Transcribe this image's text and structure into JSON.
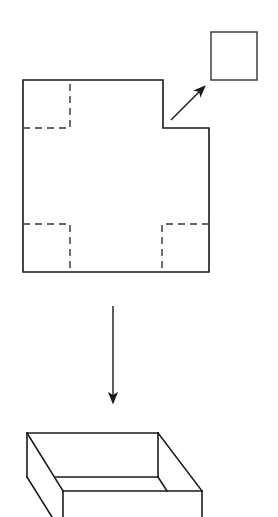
{
  "diagram": {
    "title": "",
    "canvas": {
      "width": 278,
      "height": 517,
      "background": "#ffffff"
    },
    "colors": {
      "stroke": "#1a1a1a",
      "dash_stroke": "#333333"
    },
    "net": {
      "description": "Square sheet with corner squares marked by dashed lines; one corner square cut out",
      "outline_points": "23,80 163,80 163,128 209,128 209,272 23,272 23,80",
      "dashed_corners": [
        {
          "name": "top-left",
          "path": "M23,128 L70,128 L70,80"
        },
        {
          "name": "bottom-left",
          "path": "M23,224 L70,224 L70,272"
        },
        {
          "name": "bottom-right",
          "path": "M209,224 L162,224 L162,272"
        }
      ]
    },
    "cut_square": {
      "x": 211,
      "y": 32,
      "width": 46,
      "height": 48
    },
    "cut_arrow": {
      "x1": 171,
      "y1": 120,
      "x2": 204,
      "y2": 87
    },
    "fold_arrow": {
      "x1": 113,
      "y1": 306,
      "x2": 113,
      "y2": 402
    },
    "box": {
      "description": "Open-top box formed by folding up the sides",
      "edges": [
        "M27,433 L158,433",
        "M27,433 L63,491",
        "M158,433 L202,491",
        "M63,491 L202,491",
        "M27,433 L27,477",
        "M27,477 L52,517",
        "M158,433 L158,477",
        "M55,477 L158,477",
        "M158,477 L167,491",
        "M63,491 L63,517",
        "M202,491 L202,517"
      ]
    }
  }
}
